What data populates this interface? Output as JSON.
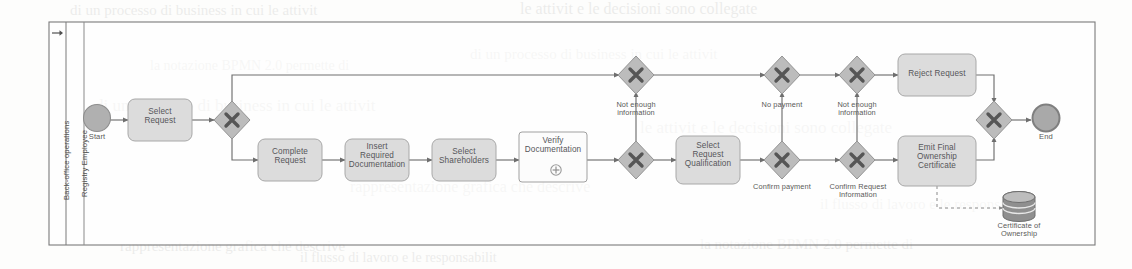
{
  "diagram": {
    "type": "bpmn-process",
    "pool": {
      "name": "Back-office operations"
    },
    "lane": {
      "name": "Registry Employee"
    },
    "pool_marker_icon": "arrow-right-icon",
    "colors": {
      "shape_fill": "#d9d9d9",
      "shape_stroke": "#a8a8a8",
      "gateway_fill": "#b9b9b9",
      "gateway_stroke": "#909090",
      "event_fill": "#a8a8a8",
      "subprocess_fill": "#ffffff",
      "connector": "#6e6e6e",
      "frame": "#7a7a7a",
      "text": "#56565a"
    },
    "events": [
      {
        "id": "start",
        "kind": "start-event",
        "label": "Start"
      },
      {
        "id": "end",
        "kind": "end-event",
        "label": "End"
      }
    ],
    "tasks": [
      {
        "id": "t_select_request",
        "label": "Select\nRequest",
        "kind": "task"
      },
      {
        "id": "t_complete_request",
        "label": "Complete\nRequest",
        "kind": "task"
      },
      {
        "id": "t_insert_docs",
        "label": "Insert\nRequired\nDocumentation",
        "kind": "task"
      },
      {
        "id": "t_select_shareholders",
        "label": "Select\nShareholders",
        "kind": "task"
      },
      {
        "id": "t_verify_docs",
        "label": "Verify\nDocumentation",
        "kind": "collapsed-subprocess",
        "marker": "plus-icon"
      },
      {
        "id": "t_select_qualification",
        "label": "Select\nRequest\nQualification",
        "kind": "task"
      },
      {
        "id": "t_reject_request",
        "label": "Reject Request",
        "kind": "task"
      },
      {
        "id": "t_emit_certificate",
        "label": "Emit Final\nOwnership\nCertificate",
        "kind": "task"
      }
    ],
    "gateways": [
      {
        "id": "g1",
        "kind": "exclusive-gateway"
      },
      {
        "id": "g_top_1",
        "kind": "exclusive-gateway"
      },
      {
        "id": "g_bot_1",
        "kind": "exclusive-gateway"
      },
      {
        "id": "g_top_2",
        "kind": "exclusive-gateway"
      },
      {
        "id": "g_bot_2",
        "kind": "exclusive-gateway"
      },
      {
        "id": "g_top_3",
        "kind": "exclusive-gateway"
      },
      {
        "id": "g_bot_3",
        "kind": "exclusive-gateway"
      },
      {
        "id": "g_merge",
        "kind": "exclusive-gateway"
      }
    ],
    "flow_labels": [
      {
        "id": "fl_not_enough_1",
        "text": "Not enough\ninformation"
      },
      {
        "id": "fl_no_payment",
        "text": "No payment"
      },
      {
        "id": "fl_confirm_payment",
        "text": "Confirm payment"
      },
      {
        "id": "fl_not_enough_2",
        "text": "Not enough\ninformation"
      },
      {
        "id": "fl_confirm_request_info",
        "text": "Confirm Request\nInformation"
      }
    ],
    "data_stores": [
      {
        "id": "ds_cert",
        "label": "Certificate of\nOwnership",
        "kind": "data-store"
      }
    ]
  },
  "background_ghost_lines": [
    "di un processo di business in cui le attivit",
    "le attivit  e le decisioni sono collegate",
    "rappresentazione grafica che descrive",
    "il flusso di lavoro e le responsabilit",
    "la notazione BPMN 2.0 permette di"
  ]
}
